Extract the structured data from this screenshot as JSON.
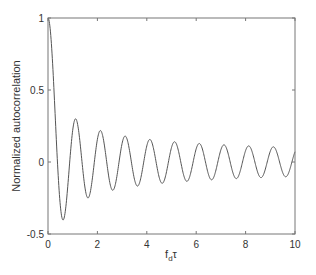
{
  "chart_data": {
    "type": "line",
    "title": "",
    "xlabel": "f_d τ",
    "xlabel_main": "f",
    "xlabel_sub": "d",
    "xlabel_tail": "τ",
    "ylabel": "Normalized autocorrelation",
    "xlim": [
      0,
      10
    ],
    "ylim": [
      -0.5,
      1
    ],
    "xticks": [
      0,
      2,
      4,
      6,
      8,
      10
    ],
    "xtick_labels": [
      "0",
      "2",
      "4",
      "6",
      "8",
      "10"
    ],
    "yticks": [
      -0.5,
      0,
      0.5,
      1
    ],
    "ytick_labels": [
      "-0.5",
      "0",
      "0.5",
      "1"
    ],
    "grid": false,
    "legend": null,
    "series": [
      {
        "name": "J0(2π f_d τ)",
        "color": "#555555",
        "function": "besselj0(2*pi*x)",
        "x": [
          0,
          0.1,
          0.2,
          0.3,
          0.4,
          0.5,
          0.6,
          0.7,
          0.8,
          0.9,
          1.0,
          1.1,
          1.2,
          1.5,
          1.6,
          2.0,
          2.1,
          2.6,
          3.1,
          3.6,
          4.1,
          4.6,
          5.1,
          5.6,
          6.1,
          6.6,
          7.1,
          7.6,
          8.1,
          8.6,
          9.1,
          9.6,
          10.0
        ],
        "values": [
          1.0,
          0.905,
          0.646,
          0.303,
          -0.034,
          -0.304,
          -0.402,
          -0.331,
          -0.138,
          0.093,
          0.22,
          0.298,
          0.258,
          -0.181,
          -0.249,
          0.159,
          0.219,
          -0.195,
          0.18,
          -0.167,
          0.157,
          -0.148,
          0.14,
          -0.134,
          0.129,
          -0.124,
          0.119,
          -0.115,
          0.112,
          -0.108,
          0.105,
          -0.103,
          0.08
        ]
      }
    ]
  },
  "colors": {
    "axes": "#777777",
    "line": "#555555",
    "text": "#333333",
    "background": "#ffffff"
  }
}
